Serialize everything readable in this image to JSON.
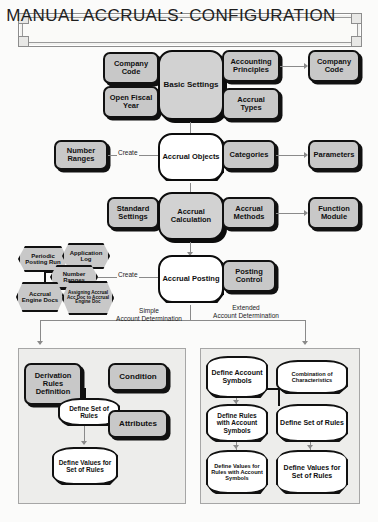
{
  "title": "MANUAL ACCRUALS: CONFIGURATION",
  "diagram": {
    "type": "flowchart",
    "rows": {
      "basic_settings": {
        "center": "Basic Settings",
        "left": [
          "Company Code",
          "Open Fiscal Year"
        ],
        "right": [
          "Accounting Principles",
          "Accrual Types"
        ],
        "far_right": "Company Code"
      },
      "accrual_objects": {
        "center": "Accrual Objects",
        "left": "Number Ranges",
        "left_edge_label": "Create",
        "right": "Categories",
        "far_right": "Parameters"
      },
      "accrual_calculation": {
        "center": "Accrual Calculation",
        "left": "Standard Settings",
        "right": "Accrual Methods",
        "far_right": "Function Module"
      },
      "accrual_posting": {
        "center": "Accrual Posting",
        "right": "Posting Control",
        "left_edge_label": "Create",
        "cluster": [
          "Periodic Posting Run",
          "Application Log",
          "Number Ranges",
          "Accrual Engine Docs",
          "Assigning Accrual Acc Doc to Accrual Engine Doc"
        ]
      }
    },
    "branches": {
      "left_label_line1": "Simple",
      "left_label_line2": "Account Determination",
      "right_label_line1": "Extended",
      "right_label_line2": "Account Determination"
    },
    "simple_panel": {
      "derivation": "Derivation Rules Definition",
      "condition": "Condition",
      "define_set": "Define Set of Rules",
      "attributes": "Attributes",
      "define_values": "Define Values for Set of Rules"
    },
    "extended_panel": {
      "define_account_symbols": "Define Account Symbols",
      "combination": "Combination of Characteristics",
      "define_rules_with": "Define Rules with Account Symbols",
      "define_set_of_rules": "Define Set of Rules",
      "define_values_rules_with": "Define Values for Rules with Account Symbols",
      "define_values_set": "Define Values for Set of Rules"
    }
  },
  "colors": {
    "node_fill": "#c8c8c8",
    "node_border": "#111111",
    "panel_fill": "#ededeb",
    "connector": "#8a8a8a",
    "page_bg": "#fbfbfa"
  }
}
